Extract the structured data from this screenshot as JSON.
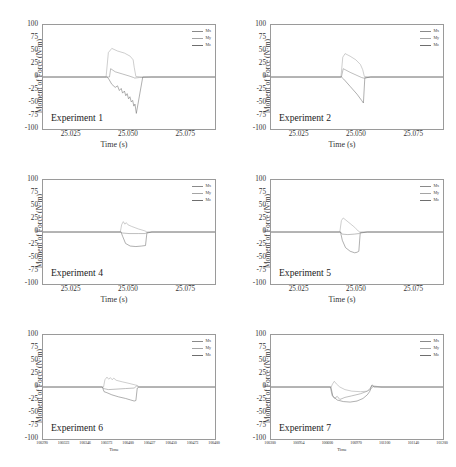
{
  "figure": {
    "panel_count": 6,
    "grid": "2 columns x 3 rows"
  },
  "axis": {
    "ylabel": "Moment of Force (N·m)",
    "yticks": [
      "100",
      "75",
      "50",
      "25",
      "0",
      "-25",
      "-50",
      "-75",
      "-100"
    ],
    "xlabel_time_s": "Time (s)",
    "xlabel_time": "Time",
    "xticks_seconds": [
      "25.025",
      "25.050",
      "25.075"
    ],
    "xticks_samples_exp6": [
      "100290",
      "100323",
      "100346",
      "100373",
      "100400",
      "100427",
      "100450",
      "100473",
      "100400"
    ],
    "xticks_samples_exp7": [
      "100300",
      "100954",
      "100600",
      "100970",
      "101100",
      "101140",
      "101200"
    ]
  },
  "legend": {
    "entries": [
      {
        "label": "Mx",
        "color": "#8a8a8a"
      },
      {
        "label": "My",
        "color": "#a5a5a5"
      },
      {
        "label": "Mz",
        "color": "#6e6e6e"
      }
    ]
  },
  "panels": [
    {
      "id": "experiment-1",
      "title": "Experiment 1"
    },
    {
      "id": "experiment-2",
      "title": "Experiment 2"
    },
    {
      "id": "experiment-4",
      "title": "Experiment 4"
    },
    {
      "id": "experiment-5",
      "title": "Experiment 5"
    },
    {
      "id": "experiment-6",
      "title": "Experiment 6"
    },
    {
      "id": "experiment-7",
      "title": "Experiment 7"
    }
  ],
  "chart_data": [
    {
      "type": "line",
      "title": "Experiment 1",
      "xlabel": "Time (s)",
      "ylabel": "Moment of Force (N·m)",
      "xlim": [
        25.0125,
        25.0875
      ],
      "ylim": [
        -100,
        100
      ],
      "xticks": [
        25.025,
        25.05,
        25.075
      ],
      "yticks": [
        -100,
        -75,
        -50,
        -25,
        0,
        25,
        50,
        75,
        100
      ],
      "grid": false,
      "legend_position": "top-right",
      "series": [
        {
          "name": "Mx",
          "color": "#8a8a8a",
          "x": [
            25.0125,
            25.0415,
            25.042,
            25.044,
            25.047,
            25.05,
            25.052,
            25.0525,
            25.0545,
            25.06,
            25.0875
          ],
          "y": [
            0,
            0,
            16,
            10,
            6,
            2,
            -1,
            -2,
            -1,
            0,
            0
          ]
        },
        {
          "name": "My",
          "color": "#a5a5a5",
          "x": [
            25.0125,
            25.04,
            25.041,
            25.0425,
            25.045,
            25.048,
            25.0505,
            25.0518,
            25.0523,
            25.053,
            25.056,
            25.0875
          ],
          "y": [
            0,
            0,
            47,
            55,
            50,
            46,
            40,
            33,
            18,
            1,
            0,
            0
          ]
        },
        {
          "name": "Mz",
          "color": "#6e6e6e",
          "x": [
            25.0125,
            25.0405,
            25.0412,
            25.0425,
            25.044,
            25.045,
            25.0458,
            25.0466,
            25.0472,
            25.048,
            25.0486,
            25.0492,
            25.0498,
            25.0504,
            25.051,
            25.0516,
            25.0521,
            25.0526,
            25.0532,
            25.056,
            25.0875
          ],
          "y": [
            0,
            0,
            -4,
            -14,
            -20,
            -17,
            -26,
            -22,
            -31,
            -27,
            -36,
            -32,
            -42,
            -38,
            -48,
            -45,
            -56,
            -52,
            -70,
            0,
            0
          ]
        }
      ]
    },
    {
      "type": "line",
      "title": "Experiment 2",
      "xlabel": "Time (s)",
      "ylabel": "Moment of Force (N·m)",
      "xlim": [
        25.0125,
        25.0875
      ],
      "ylim": [
        -100,
        100
      ],
      "xticks": [
        25.025,
        25.05,
        25.075
      ],
      "yticks": [
        -100,
        -75,
        -50,
        -25,
        0,
        25,
        50,
        75,
        100
      ],
      "grid": false,
      "legend_position": "top-right",
      "series": [
        {
          "name": "Mx",
          "color": "#8a8a8a",
          "x": [
            25.0125,
            25.0432,
            25.044,
            25.047,
            25.05,
            25.052,
            25.0528,
            25.056,
            25.0875
          ],
          "y": [
            0,
            0,
            16,
            9,
            3,
            -1,
            -2,
            0,
            0
          ]
        },
        {
          "name": "My",
          "color": "#a5a5a5",
          "x": [
            25.0125,
            25.043,
            25.0438,
            25.0448,
            25.047,
            25.0495,
            25.0515,
            25.0525,
            25.0532,
            25.056,
            25.0875
          ],
          "y": [
            0,
            0,
            38,
            45,
            40,
            33,
            24,
            14,
            1,
            0,
            0
          ]
        },
        {
          "name": "Mz",
          "color": "#6e6e6e",
          "x": [
            25.0125,
            25.0432,
            25.0442,
            25.047,
            25.05,
            25.052,
            25.0528,
            25.0534,
            25.056,
            25.0875
          ],
          "y": [
            0,
            0,
            -4,
            -18,
            -33,
            -45,
            -50,
            -2,
            0,
            0
          ]
        }
      ]
    },
    {
      "type": "line",
      "title": "Experiment 4",
      "xlabel": "Time (s)",
      "ylabel": "Moment of Force (N·m)",
      "xlim": [
        25.0125,
        25.0875
      ],
      "ylim": [
        -100,
        100
      ],
      "xticks": [
        25.025,
        25.05,
        25.075
      ],
      "yticks": [
        -100,
        -75,
        -50,
        -25,
        0,
        25,
        50,
        75,
        100
      ],
      "grid": false,
      "legend_position": "top-right",
      "series": [
        {
          "name": "Mx",
          "color": "#8a8a8a",
          "x": [
            25.0125,
            25.0465,
            25.0472,
            25.05,
            25.054,
            25.057,
            25.0578,
            25.06,
            25.0875
          ],
          "y": [
            0,
            0,
            -2,
            -3,
            -3,
            -3,
            -1,
            0,
            0
          ]
        },
        {
          "name": "My",
          "color": "#a5a5a5",
          "x": [
            25.0125,
            25.0462,
            25.0468,
            25.0475,
            25.0482,
            25.0488,
            25.0495,
            25.051,
            25.054,
            25.057,
            25.0578,
            25.06,
            25.0875
          ],
          "y": [
            0,
            0,
            14,
            20,
            15,
            18,
            14,
            11,
            6,
            2,
            0,
            0,
            0
          ]
        },
        {
          "name": "Mz",
          "color": "#6e6e6e",
          "x": [
            25.0125,
            25.0465,
            25.0472,
            25.0485,
            25.0505,
            25.053,
            25.0555,
            25.0572,
            25.0578,
            25.06,
            25.0875
          ],
          "y": [
            0,
            0,
            -8,
            -22,
            -27,
            -28,
            -27,
            -26,
            -2,
            0,
            0
          ]
        }
      ]
    },
    {
      "type": "line",
      "title": "Experiment 5",
      "xlabel": "Time (s)",
      "ylabel": "Moment of Force (N·m)",
      "xlim": [
        25.0125,
        25.0875
      ],
      "ylim": [
        -100,
        100
      ],
      "xticks": [
        25.025,
        25.05,
        25.075
      ],
      "yticks": [
        -100,
        -75,
        -50,
        -25,
        0,
        25,
        50,
        75,
        100
      ],
      "grid": false,
      "legend_position": "top-right",
      "series": [
        {
          "name": "Mx",
          "color": "#8a8a8a",
          "x": [
            25.0125,
            25.0428,
            25.0435,
            25.046,
            25.049,
            25.0508,
            25.0515,
            25.0545,
            25.0875
          ],
          "y": [
            0,
            0,
            -4,
            -5,
            -4,
            -3,
            -1,
            0,
            0
          ]
        },
        {
          "name": "My",
          "color": "#a5a5a5",
          "x": [
            25.0125,
            25.0425,
            25.0432,
            25.044,
            25.0465,
            25.049,
            25.0505,
            25.0512,
            25.0545,
            25.0875
          ],
          "y": [
            0,
            0,
            22,
            27,
            18,
            9,
            2,
            0,
            0,
            0
          ]
        },
        {
          "name": "Mz",
          "color": "#6e6e6e",
          "x": [
            25.0125,
            25.0428,
            25.0436,
            25.045,
            25.047,
            25.049,
            25.05,
            25.0508,
            25.0514,
            25.0545,
            25.0875
          ],
          "y": [
            0,
            0,
            -16,
            -30,
            -37,
            -40,
            -39,
            -37,
            -2,
            0,
            0
          ]
        }
      ]
    },
    {
      "type": "line",
      "title": "Experiment 6",
      "xlabel": "Time",
      "ylabel": "Moment of Force (N·m)",
      "xlim": [
        0,
        1
      ],
      "ylim": [
        -100,
        100
      ],
      "xticks_labels": [
        "100290",
        "100323",
        "100346",
        "100373",
        "100400",
        "100427",
        "100450",
        "100473",
        "100400"
      ],
      "yticks": [
        -100,
        -75,
        -50,
        -25,
        0,
        25,
        50,
        75,
        100
      ],
      "grid": false,
      "legend_position": "top-right",
      "series": [
        {
          "name": "Mx",
          "color": "#8a8a8a",
          "x": [
            0,
            0.345,
            0.352,
            0.38,
            0.43,
            0.48,
            0.53,
            0.545,
            0.56,
            1.0
          ],
          "y": [
            0,
            0,
            -3,
            -5,
            -4,
            -3,
            -2,
            2,
            0,
            0
          ]
        },
        {
          "name": "My",
          "color": "#a5a5a5",
          "x": [
            0,
            0.352,
            0.36,
            0.372,
            0.382,
            0.392,
            0.402,
            0.412,
            0.425,
            0.46,
            0.5,
            0.535,
            0.548,
            0.56,
            1.0
          ],
          "y": [
            0,
            0,
            14,
            19,
            15,
            18,
            14,
            17,
            13,
            10,
            7,
            4,
            3,
            0,
            0
          ]
        },
        {
          "name": "Mz",
          "color": "#6e6e6e",
          "x": [
            0,
            0.345,
            0.355,
            0.372,
            0.4,
            0.44,
            0.48,
            0.51,
            0.53,
            0.54,
            0.548,
            0.56,
            1.0
          ],
          "y": [
            0,
            0,
            -9,
            -11,
            -15,
            -19,
            -22,
            -25,
            -27,
            -26,
            -2,
            0,
            0
          ]
        }
      ]
    },
    {
      "type": "line",
      "title": "Experiment 7",
      "xlabel": "Time",
      "ylabel": "Moment of Force (N·m)",
      "xlim": [
        0,
        1
      ],
      "ylim": [
        -100,
        100
      ],
      "xticks_labels": [
        "100300",
        "100954",
        "100600",
        "100970",
        "101100",
        "101140",
        "101200"
      ],
      "yticks": [
        -100,
        -75,
        -50,
        -25,
        0,
        25,
        50,
        75,
        100
      ],
      "grid": false,
      "legend_position": "top-right",
      "series": [
        {
          "name": "Mx",
          "color": "#8a8a8a",
          "x": [
            0,
            0.345,
            0.355,
            0.37,
            0.385,
            0.4,
            0.43,
            0.47,
            0.52,
            0.56,
            0.575,
            0.59,
            0.6,
            0.64,
            1.0
          ],
          "y": [
            0,
            0,
            -16,
            -22,
            -18,
            -24,
            -20,
            -17,
            -13,
            -8,
            -3,
            4,
            1,
            0,
            0
          ]
        },
        {
          "name": "My",
          "color": "#a5a5a5",
          "x": [
            0,
            0.35,
            0.358,
            0.368,
            0.38,
            0.4,
            0.43,
            0.47,
            0.52,
            0.56,
            0.58,
            0.6,
            0.64,
            1.0
          ],
          "y": [
            0,
            0,
            6,
            11,
            6,
            0,
            -5,
            -8,
            -9,
            -8,
            -4,
            2,
            0,
            0
          ]
        },
        {
          "name": "Mz",
          "color": "#6e6e6e",
          "x": [
            0,
            0.348,
            0.36,
            0.385,
            0.42,
            0.46,
            0.5,
            0.535,
            0.56,
            0.575,
            0.585,
            0.6,
            0.64,
            1.0
          ],
          "y": [
            0,
            0,
            -18,
            -25,
            -28,
            -29,
            -27,
            -22,
            -15,
            -8,
            3,
            0,
            0,
            0
          ]
        }
      ]
    }
  ]
}
